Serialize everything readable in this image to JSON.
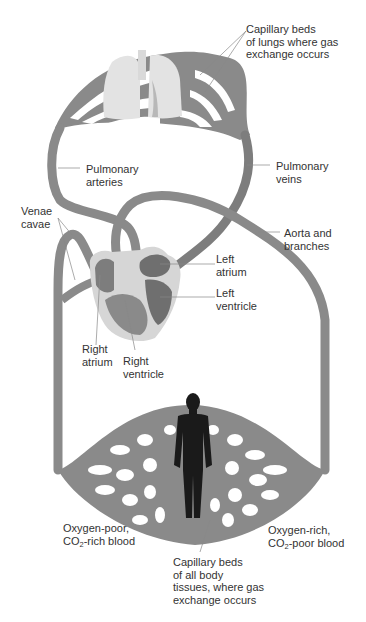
{
  "diagram": {
    "colors": {
      "vessel": "#8a8a8a",
      "vessel_dark": "#6f6f6f",
      "heart_outer": "#d6d6d6",
      "heart_chamber": "#7d7d7d",
      "lungs": "#e3e3e3",
      "body_silhouette": "#1a1a1a",
      "leader_line": "#888888",
      "text": "#333333"
    },
    "labels": {
      "capillary_lungs": [
        "Capillary beds",
        "of lungs where gas",
        "exchange occurs"
      ],
      "pulmonary_arteries": [
        "Pulmonary",
        "arteries"
      ],
      "pulmonary_veins": [
        "Pulmonary",
        "veins"
      ],
      "venae_cavae": [
        "Venae",
        "cavae"
      ],
      "aorta": [
        "Aorta and",
        "branches"
      ],
      "left_atrium": [
        "Left",
        "atrium"
      ],
      "left_ventricle": [
        "Left",
        "ventricle"
      ],
      "right_atrium": [
        "Right",
        "atrium"
      ],
      "right_ventricle": [
        "Right",
        "ventricle"
      ],
      "oxygen_poor": {
        "line1": "Oxygen-poor,",
        "line2_pre": "CO",
        "line2_sub": "2",
        "line2_post": "-rich blood"
      },
      "oxygen_rich": {
        "line1": "Oxygen-rich,",
        "line2_pre": "CO",
        "line2_sub": "2",
        "line2_post": "-poor blood"
      },
      "capillary_body": [
        "Capillary beds",
        "of all body",
        "tissues, where gas",
        "exchange occurs"
      ]
    }
  }
}
